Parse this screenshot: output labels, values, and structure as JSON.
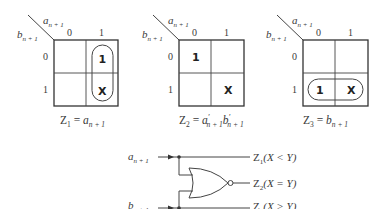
{
  "kmaps": [
    {
      "id": "z1",
      "col_var": "a",
      "row_var": "b",
      "subscript": "n + 1",
      "col_headers": [
        "0",
        "1"
      ],
      "row_headers": [
        "0",
        "1"
      ],
      "cells": [
        [
          "",
          "1"
        ],
        [
          "",
          "X"
        ]
      ],
      "loop": "column-1",
      "equation": {
        "lhs": "Z",
        "lhs_sub": "1",
        "rhs": "a",
        "rhs_sub": "n + 1"
      }
    },
    {
      "id": "z2",
      "col_var": "a",
      "row_var": "b",
      "subscript": "n + 1",
      "col_headers": [
        "0",
        "1"
      ],
      "row_headers": [
        "0",
        "1"
      ],
      "cells": [
        [
          "1",
          ""
        ],
        [
          "",
          "X"
        ]
      ],
      "loop": "none",
      "equation": {
        "lhs": "Z",
        "lhs_sub": "2",
        "rhs1": "a",
        "rhs1_sup": "′",
        "rhs1_sub": "n + 1",
        "rhs2": "b",
        "rhs2_sup": "′",
        "rhs2_sub": "n + 1"
      }
    },
    {
      "id": "z3",
      "col_var": "a",
      "row_var": "b",
      "subscript": "n + 1",
      "col_headers": [
        "0",
        "1"
      ],
      "row_headers": [
        "0",
        "1"
      ],
      "cells": [
        [
          "",
          ""
        ],
        [
          "1",
          "X"
        ]
      ],
      "loop": "row-1",
      "equation": {
        "lhs": "Z",
        "lhs_sub": "3",
        "rhs": "b",
        "rhs_sub": "n + 1"
      }
    }
  ],
  "circuit": {
    "inputs": [
      {
        "var": "a",
        "sub": "n + 1"
      },
      {
        "var": "b",
        "sub": "n + 1"
      }
    ],
    "gate": "NOR",
    "outputs": [
      {
        "name": "Z",
        "sub": "1",
        "cond": "(X < Y)"
      },
      {
        "name": "Z",
        "sub": "2",
        "cond": "(X = Y)"
      },
      {
        "name": "Z",
        "sub": "3",
        "cond": "(X > Y)"
      }
    ]
  },
  "colors": {
    "line": "#444444",
    "text": "#3a3a3a",
    "background": "#ffffff"
  }
}
